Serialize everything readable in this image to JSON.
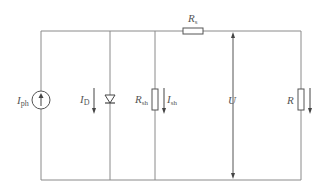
{
  "diagram": {
    "colors": {
      "wire": "#8a8a8a",
      "component": "#555555",
      "label": "#555555",
      "background": "#ffffff"
    },
    "components": [
      {
        "id": "current-source",
        "type": "current_source",
        "label": "I",
        "label_sub": "ph"
      },
      {
        "id": "diode",
        "type": "diode",
        "current_label": "I",
        "current_sub": "D"
      },
      {
        "id": "shunt-resistor",
        "type": "resistor",
        "label": "R",
        "label_sub": "sh",
        "current_label": "I",
        "current_sub": "sh"
      },
      {
        "id": "series-resistor",
        "type": "resistor",
        "label": "R",
        "label_sub": "s"
      },
      {
        "id": "voltage",
        "type": "voltage_arrow",
        "label": "U"
      },
      {
        "id": "load-resistor",
        "type": "resistor",
        "label": "R"
      }
    ],
    "labels": {
      "iph_main": "I",
      "iph_sub": "ph",
      "id_main": "I",
      "id_sub": "D",
      "rsh_main": "R",
      "rsh_sub": "sh",
      "ish_main": "I",
      "ish_sub": "sh",
      "rs_main": "R",
      "rs_sub": "s",
      "u": "U",
      "r": "R"
    }
  }
}
